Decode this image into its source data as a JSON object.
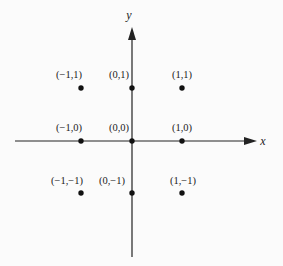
{
  "diagram": {
    "type": "coordinate-grid",
    "axes": {
      "x_label": "x",
      "y_label": "y"
    },
    "points": [
      {
        "label": "(−1,1)",
        "x": -1,
        "y": 1
      },
      {
        "label": "(0,1)",
        "x": 0,
        "y": 1
      },
      {
        "label": "(1,1)",
        "x": 1,
        "y": 1
      },
      {
        "label": "(−1,0)",
        "x": -1,
        "y": 0
      },
      {
        "label": "(0,0)",
        "x": 0,
        "y": 0
      },
      {
        "label": "(1,0)",
        "x": 1,
        "y": 0
      },
      {
        "label": "(−1,−1)",
        "x": -1,
        "y": -1
      },
      {
        "label": "(0,−1)",
        "x": 0,
        "y": -1
      },
      {
        "label": "(1,−1)",
        "x": 1,
        "y": -1
      }
    ],
    "colors": {
      "ink": "#222222",
      "background": "#fbfbfb"
    }
  }
}
